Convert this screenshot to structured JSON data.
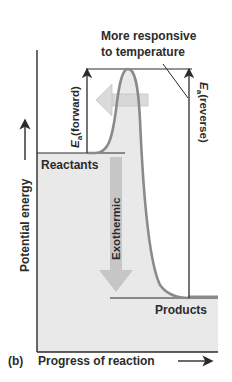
{
  "diagram": {
    "panel_label": "(b)",
    "x_axis_label": "Progress of reaction",
    "y_axis_label": "Potential energy",
    "annotation": [
      "More responsive",
      "to temperature"
    ],
    "reactants_label": "Reactants",
    "products_label": "Products",
    "exothermic_label": "Exothermic",
    "ea_forward": {
      "symbol": "E",
      "subscript": "a",
      "suffix": "(forward)"
    },
    "ea_reverse": {
      "symbol": "E",
      "subscript": "a",
      "suffix": "(reverse)"
    },
    "colors": {
      "curve": "#8a8a8a",
      "fill": "#e9e9e9",
      "arrow_fill": "#c6c6c6",
      "line": "#2b2b2b"
    }
  }
}
